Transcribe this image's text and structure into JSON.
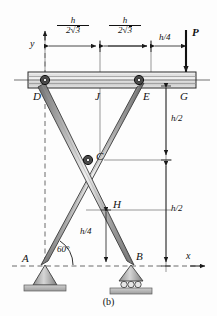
{
  "figure": {
    "caption": "(b)",
    "axes": {
      "x_label": "x",
      "y_label": "y"
    }
  },
  "load": {
    "symbol": "P"
  },
  "nodes": [
    {
      "id": "A",
      "label": "A"
    },
    {
      "id": "B",
      "label": "B"
    },
    {
      "id": "C",
      "label": "C"
    },
    {
      "id": "D",
      "label": "D"
    },
    {
      "id": "E",
      "label": "E"
    },
    {
      "id": "G",
      "label": "G"
    },
    {
      "id": "H",
      "label": "H"
    },
    {
      "id": "J",
      "label": "J"
    }
  ],
  "dimensions": {
    "top_left": {
      "numerator": "h",
      "denominator_coef": "2",
      "denominator_radical": "3"
    },
    "top_mid": {
      "numerator": "h",
      "denominator_coef": "2",
      "denominator_radical": "3"
    },
    "top_right": "h/4",
    "right_upper": "h/2",
    "right_lower": "h/2",
    "inner_vertical": "h/4",
    "angle": "60°"
  },
  "supports": [
    {
      "at": "A",
      "type": "pin"
    },
    {
      "at": "B",
      "type": "roller"
    }
  ],
  "colors": {
    "member_light": "#f2f2f2",
    "member_mid": "#b9b9b9",
    "member_dark": "#6f6f6f",
    "outline": "#2a2a2a",
    "dashed": "#6a6a6a",
    "beam_fill": "#d8d8d8"
  }
}
